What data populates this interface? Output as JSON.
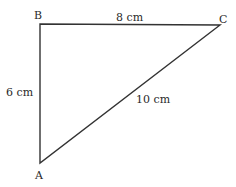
{
  "diagram": {
    "type": "right-triangle",
    "vertices": {
      "A": {
        "label": "A",
        "x": 40,
        "y": 163
      },
      "B": {
        "label": "B",
        "x": 40,
        "y": 24
      },
      "C": {
        "label": "C",
        "x": 220,
        "y": 25
      }
    },
    "sides": {
      "AB": {
        "label": "6 cm"
      },
      "BC": {
        "label": "8 cm"
      },
      "AC": {
        "label": "10 cm"
      }
    },
    "stroke_color": "#333333"
  }
}
